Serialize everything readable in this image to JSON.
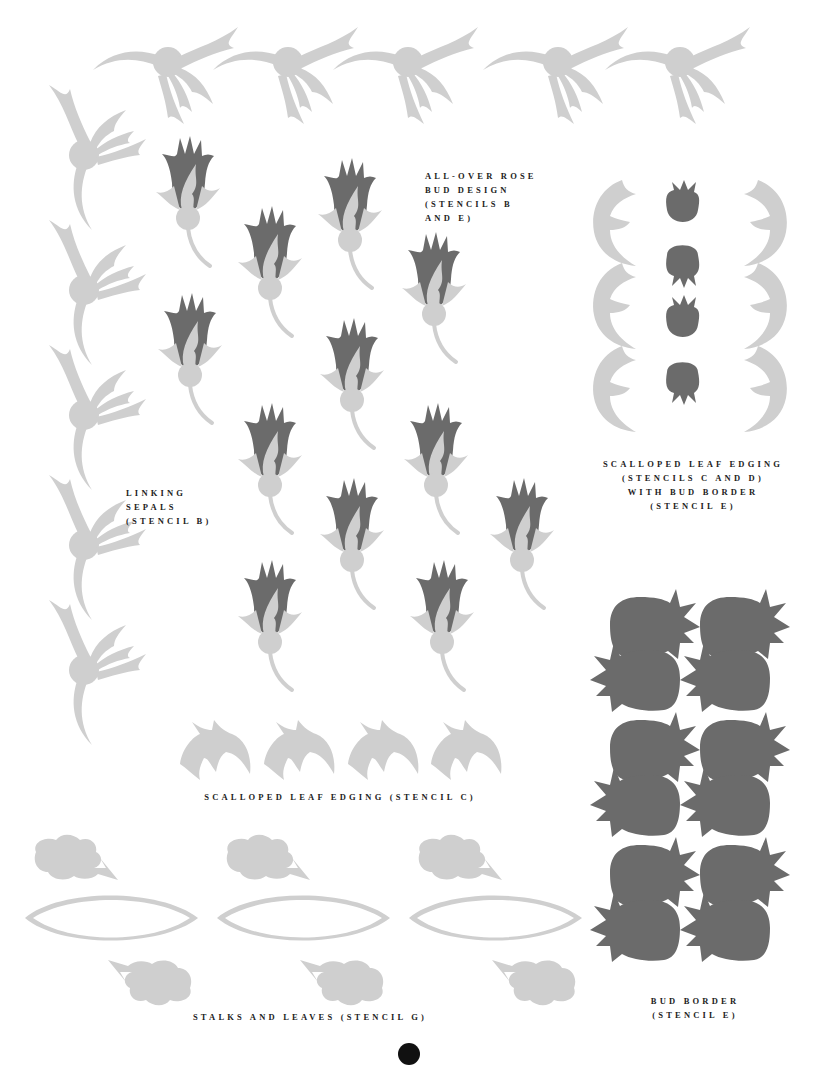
{
  "colors": {
    "bud": "#6b6b6b",
    "sepal": "#cfcfcf",
    "text": "#222222",
    "background": "#ffffff"
  },
  "captions": {
    "allover": {
      "lines": [
        "All-over rose",
        "bud design",
        "(stencils B",
        "and E)"
      ]
    },
    "linking": {
      "lines": [
        "Linking",
        "sepals",
        "(stencil B)"
      ]
    },
    "scalloped_bud": {
      "lines": [
        "Scalloped leaf edging",
        "(stencils C and D)",
        "with bud border",
        "(stencil E)"
      ]
    },
    "scalloped": {
      "lines": [
        "Scalloped leaf edging (stencil C)"
      ]
    },
    "stalks": {
      "lines": [
        "Stalks and leaves (stencil G)"
      ]
    },
    "bud_border": {
      "lines": [
        "Bud border",
        "(stencil E)"
      ]
    }
  },
  "motifs": {
    "top_sepal_row_count": 5,
    "left_sepal_column_count": 5,
    "rose_buds_count": 13,
    "scalloped_leaf_count": 4,
    "stalk_leaf_groups": 3,
    "bud_border_pairs": 6
  }
}
